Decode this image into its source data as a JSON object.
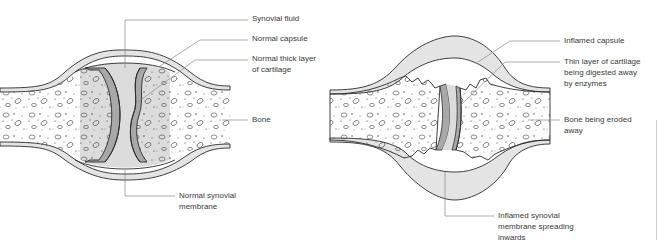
{
  "figure": {
    "left_panel": {
      "name": "normal-joint",
      "labels": [
        {
          "id": "synovial-fluid",
          "text": "Synovial fluid"
        },
        {
          "id": "normal-capsule",
          "text": "Normal capsule"
        },
        {
          "id": "cartilage-line1",
          "text": "Normal thick layer"
        },
        {
          "id": "cartilage-line2",
          "text": "of cartilage"
        },
        {
          "id": "bone",
          "text": "Bone"
        },
        {
          "id": "synovial-membrane-line1",
          "text": "Normal synovial"
        },
        {
          "id": "synovial-membrane-line2",
          "text": "membrane"
        }
      ]
    },
    "right_panel": {
      "name": "inflamed-joint",
      "labels": [
        {
          "id": "inflamed-capsule",
          "text": "Inflamed capsule"
        },
        {
          "id": "thin-cartilage-line1",
          "text": "Thin layer of cartilage"
        },
        {
          "id": "thin-cartilage-line2",
          "text": "being digested away"
        },
        {
          "id": "thin-cartilage-line3",
          "text": "by enzymes"
        },
        {
          "id": "bone-eroded-line1",
          "text": "Bone being eroded"
        },
        {
          "id": "bone-eroded-line2",
          "text": "away"
        },
        {
          "id": "inflamed-membrane-line1",
          "text": "Inflamed synovial"
        },
        {
          "id": "inflamed-membrane-line2",
          "text": "membrane spreading"
        },
        {
          "id": "inflamed-membrane-line3",
          "text": "inwards"
        }
      ]
    },
    "colors": {
      "outline": "#2b2b2b",
      "leader_line": "#8a8a8a",
      "capsule_fill": "#e4e4e4",
      "synovial_fill": "#dcdcdc",
      "cartilage_fill": "#a8a8a8",
      "bone_fill": "#ffffff",
      "text": "#3a3a3a"
    }
  }
}
